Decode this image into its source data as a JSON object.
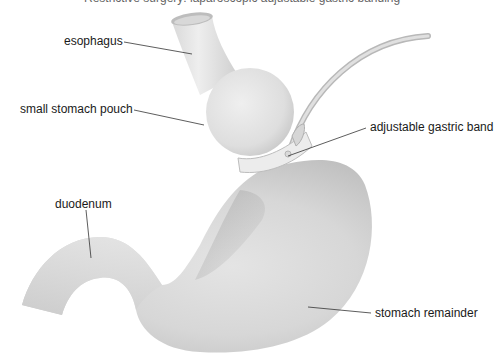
{
  "diagram": {
    "title_partial": "Restrictive surgery: laparoscopic adjustable gastric banding",
    "colors": {
      "organ_light": "#eeeeee",
      "organ_mid": "#d6d6d6",
      "organ_shadow": "#a9a9a9",
      "band": "#e9e9e9",
      "band_edge": "#bdbdbd",
      "tube": "#cfcfcf",
      "leader": "#333333",
      "text": "#1a1a1a"
    },
    "labels": {
      "esophagus": "esophagus",
      "pouch": "small stomach pouch",
      "band": "adjustable gastric band",
      "duodenum": "duodenum",
      "remainder": "stomach remainder"
    }
  }
}
